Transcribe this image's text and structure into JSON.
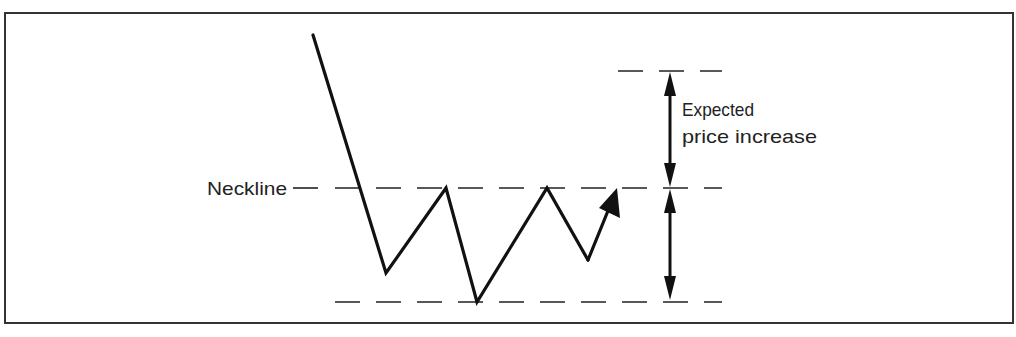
{
  "diagram": {
    "type": "inverse-head-and-shoulders",
    "colors": {
      "ink": "#111111",
      "text": "#222222",
      "background": "#ffffff",
      "frame": "#333333"
    },
    "labels": {
      "neckline": "Neckline",
      "expected_line1": "Expected",
      "expected_line2": "price increase"
    },
    "price_path": [
      [
        313,
        35
      ],
      [
        386,
        273
      ],
      [
        446,
        188
      ],
      [
        477,
        302
      ],
      [
        547,
        188
      ],
      [
        588,
        260
      ]
    ],
    "breakout_arrow": {
      "from": [
        588,
        260
      ],
      "to": [
        617,
        188
      ]
    },
    "levels": {
      "target_y": 71,
      "neckline_y": 188,
      "bottom_y": 302
    },
    "measure_x": 670
  }
}
